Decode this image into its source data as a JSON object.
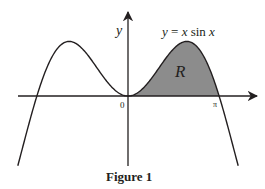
{
  "figure": {
    "caption": "Figure 1",
    "curve_label": "y = x sin x",
    "region_label": "R",
    "axis_y_label": "y",
    "origin_label": "0",
    "pi_label": "π",
    "colors": {
      "line": "#231f20",
      "region_fill": "#8c8c8c",
      "background": "#ffffff"
    }
  },
  "chart_data": {
    "type": "line",
    "title": "Figure 1",
    "function": "y = x sin x",
    "xlabel": "",
    "ylabel": "y",
    "x_ticks": [
      "0",
      "π"
    ],
    "x_range": [
      -3.8,
      3.8
    ],
    "shaded_region": {
      "label": "R",
      "x_from": 0,
      "x_to": 3.14159,
      "bounded_by": "curve and x-axis"
    },
    "grid": false,
    "legend": "none"
  }
}
